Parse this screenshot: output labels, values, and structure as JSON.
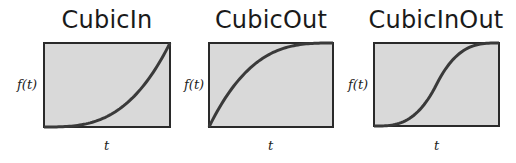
{
  "chart_data": [
    {
      "type": "line",
      "title": "CubicIn",
      "xlabel": "t",
      "ylabel": "f(t)",
      "x": [
        0,
        0.1,
        0.2,
        0.3,
        0.4,
        0.5,
        0.6,
        0.7,
        0.8,
        0.9,
        1.0
      ],
      "series": [
        {
          "name": "CubicIn",
          "values": [
            0,
            0.001,
            0.008,
            0.027,
            0.064,
            0.125,
            0.216,
            0.343,
            0.512,
            0.729,
            1.0
          ]
        }
      ],
      "xlim": [
        0,
        1
      ],
      "ylim": [
        0,
        1
      ],
      "grid": false
    },
    {
      "type": "line",
      "title": "CubicOut",
      "xlabel": "t",
      "ylabel": "f(t)",
      "x": [
        0,
        0.1,
        0.2,
        0.3,
        0.4,
        0.5,
        0.6,
        0.7,
        0.8,
        0.9,
        1.0
      ],
      "series": [
        {
          "name": "CubicOut",
          "values": [
            0,
            0.271,
            0.488,
            0.657,
            0.784,
            0.875,
            0.936,
            0.973,
            0.992,
            0.999,
            1.0
          ]
        }
      ],
      "xlim": [
        0,
        1
      ],
      "ylim": [
        0,
        1
      ],
      "grid": false
    },
    {
      "type": "line",
      "title": "CubicInOut",
      "xlabel": "t",
      "ylabel": "f(t)",
      "x": [
        0,
        0.1,
        0.2,
        0.3,
        0.4,
        0.5,
        0.6,
        0.7,
        0.8,
        0.9,
        1.0
      ],
      "series": [
        {
          "name": "CubicInOut",
          "values": [
            0,
            0.004,
            0.032,
            0.108,
            0.256,
            0.5,
            0.744,
            0.892,
            0.968,
            0.996,
            1.0
          ]
        }
      ],
      "xlim": [
        0,
        1
      ],
      "ylim": [
        0,
        1
      ],
      "grid": false
    }
  ],
  "colors": {
    "plot_bg": "#d9d9d9",
    "frame": "#2a2a2a",
    "curve": "#3a3a3a"
  },
  "panels": [
    {
      "title": "CubicIn",
      "ylabel": "f(t)",
      "xlabel": "t"
    },
    {
      "title": "CubicOut",
      "ylabel": "f(t)",
      "xlabel": "t"
    },
    {
      "title": "CubicInOut",
      "ylabel": "f(t)",
      "xlabel": "t"
    }
  ]
}
